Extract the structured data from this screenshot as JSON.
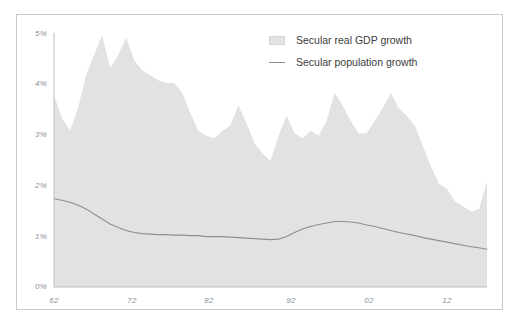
{
  "chart_data": {
    "type": "area",
    "title": "",
    "subtitle": "",
    "xlabel": "",
    "ylabel": "",
    "grid": false,
    "legend_position": "top-right",
    "ylim": [
      0,
      5
    ],
    "xlim": [
      1962,
      2016
    ],
    "y_tick_labels": [
      "5%",
      "4%",
      "3%",
      "2%",
      "1%",
      "0%"
    ],
    "y_tick_values": [
      5,
      4,
      3,
      2,
      1,
      0
    ],
    "x_tick_labels": [
      "62",
      "72",
      "82",
      "92",
      "02",
      "12"
    ],
    "x_tick_values": [
      1962,
      1972,
      1982,
      1992,
      2002,
      2012
    ],
    "x": [
      1962,
      1963,
      1964,
      1965,
      1966,
      1967,
      1968,
      1969,
      1970,
      1971,
      1972,
      1973,
      1974,
      1975,
      1976,
      1977,
      1978,
      1979,
      1980,
      1981,
      1982,
      1983,
      1984,
      1985,
      1986,
      1987,
      1988,
      1989,
      1990,
      1991,
      1992,
      1993,
      1994,
      1995,
      1996,
      1997,
      1998,
      1999,
      2000,
      2001,
      2002,
      2003,
      2004,
      2005,
      2006,
      2007,
      2008,
      2009,
      2010,
      2011,
      2012,
      2013,
      2014,
      2015,
      2016
    ],
    "series": [
      {
        "name": "Secular real GDP growth",
        "type": "area",
        "color": "#e2e2e2",
        "values": [
          3.8,
          3.35,
          3.1,
          3.55,
          4.2,
          4.6,
          5.0,
          4.35,
          4.6,
          4.95,
          4.5,
          4.3,
          4.2,
          4.1,
          4.05,
          4.05,
          3.85,
          3.45,
          3.1,
          3.0,
          2.95,
          3.1,
          3.2,
          3.6,
          3.25,
          2.85,
          2.65,
          2.5,
          3.0,
          3.4,
          3.05,
          2.95,
          3.1,
          3.0,
          3.3,
          3.85,
          3.6,
          3.3,
          3.05,
          3.05,
          3.3,
          3.55,
          3.85,
          3.55,
          3.4,
          3.2,
          2.8,
          2.4,
          2.05,
          1.95,
          1.7,
          1.6,
          1.5,
          1.55,
          2.1
        ]
      },
      {
        "name": "Secular population growth",
        "type": "line",
        "color": "#8e8e8e",
        "values": [
          1.75,
          1.72,
          1.68,
          1.62,
          1.55,
          1.45,
          1.35,
          1.25,
          1.18,
          1.12,
          1.08,
          1.06,
          1.05,
          1.04,
          1.04,
          1.03,
          1.03,
          1.02,
          1.02,
          1.0,
          1.0,
          1.0,
          0.99,
          0.98,
          0.97,
          0.96,
          0.95,
          0.94,
          0.95,
          1.0,
          1.08,
          1.15,
          1.2,
          1.24,
          1.27,
          1.3,
          1.3,
          1.29,
          1.27,
          1.23,
          1.2,
          1.16,
          1.12,
          1.08,
          1.05,
          1.02,
          0.98,
          0.95,
          0.92,
          0.89,
          0.86,
          0.83,
          0.8,
          0.78,
          0.75
        ]
      }
    ]
  },
  "legend": {
    "items": [
      {
        "label": "Secular real GDP growth",
        "marker": "area-swatch"
      },
      {
        "label": "Secular population growth",
        "marker": "line-swatch"
      }
    ]
  },
  "colors": {
    "area_fill": "#e2e2e2",
    "line": "#8e8e8e",
    "axis": "#bfbfbf",
    "tick_text": "#8a8f98",
    "legend_text": "#3c3c3c",
    "frame": "#c9c9c9"
  }
}
